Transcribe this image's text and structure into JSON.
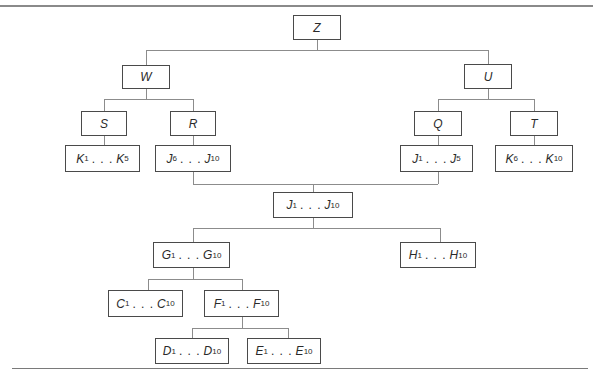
{
  "figure": {
    "caption": "Figure 10-20  (caption text cropped at top edge)"
  },
  "tree": {
    "nodes": [
      {
        "id": "Z",
        "label": "Z",
        "start": {
          "letter": "Z"
        },
        "x": 293,
        "y": 15,
        "w": 48,
        "h": 25
      },
      {
        "id": "W",
        "label": "W",
        "x": 122,
        "y": 65,
        "w": 48,
        "h": 24
      },
      {
        "id": "U",
        "label": "U",
        "x": 464,
        "y": 64,
        "w": 48,
        "h": 25
      },
      {
        "id": "S",
        "label": "S",
        "x": 81,
        "y": 111,
        "w": 46,
        "h": 25
      },
      {
        "id": "R",
        "label": "R",
        "x": 170,
        "y": 111,
        "w": 46,
        "h": 25
      },
      {
        "id": "Q",
        "label": "Q",
        "x": 414,
        "y": 111,
        "w": 48,
        "h": 25
      },
      {
        "id": "T",
        "label": "T",
        "x": 510,
        "y": 111,
        "w": 48,
        "h": 25
      },
      {
        "id": "K1K5",
        "from": "K",
        "from_sub": "1",
        "to": "K",
        "to_sub": "5",
        "x": 65,
        "y": 145,
        "w": 75,
        "h": 27
      },
      {
        "id": "J6J10",
        "from": "J",
        "from_sub": "6",
        "to": "J",
        "to_sub": "10",
        "x": 155,
        "y": 145,
        "w": 76,
        "h": 27
      },
      {
        "id": "J1J5",
        "from": "J",
        "from_sub": "1",
        "to": "J",
        "to_sub": "5",
        "x": 400,
        "y": 145,
        "w": 73,
        "h": 27
      },
      {
        "id": "K6K10",
        "from": "K",
        "from_sub": "6",
        "to": "K",
        "to_sub": "10",
        "x": 495,
        "y": 145,
        "w": 78,
        "h": 27
      },
      {
        "id": "J1J10",
        "from": "J",
        "from_sub": "1",
        "to": "J",
        "to_sub": "10",
        "x": 273,
        "y": 192,
        "w": 80,
        "h": 26
      },
      {
        "id": "G1G10",
        "from": "G",
        "from_sub": "1",
        "to": "G",
        "to_sub": "10",
        "x": 153,
        "y": 242,
        "w": 77,
        "h": 26
      },
      {
        "id": "H1H10",
        "from": "H",
        "from_sub": "1",
        "to": "H",
        "to_sub": "10",
        "x": 400,
        "y": 242,
        "w": 76,
        "h": 26
      },
      {
        "id": "C1C10",
        "from": "C",
        "from_sub": "1",
        "to": "C",
        "to_sub": "10",
        "x": 108,
        "y": 290,
        "w": 75,
        "h": 27
      },
      {
        "id": "F1F10",
        "from": "F",
        "from_sub": "1",
        "to": "F",
        "to_sub": "10",
        "x": 204,
        "y": 290,
        "w": 75,
        "h": 27
      },
      {
        "id": "D1D10",
        "from": "D",
        "from_sub": "1",
        "to": "D",
        "to_sub": "10",
        "x": 155,
        "y": 338,
        "w": 74,
        "h": 26
      },
      {
        "id": "E1E10",
        "from": "E",
        "from_sub": "1",
        "to": "E",
        "to_sub": "10",
        "x": 247,
        "y": 338,
        "w": 74,
        "h": 26
      }
    ],
    "edges": [
      {
        "parent": "Z",
        "children": [
          "W",
          "U"
        ]
      },
      {
        "parent": "W",
        "children": [
          "S",
          "R"
        ]
      },
      {
        "parent": "U",
        "children": [
          "Q",
          "T"
        ]
      },
      {
        "parent": "S",
        "children": [
          "K1K5"
        ]
      },
      {
        "parent": "R",
        "children": [
          "J6J10"
        ]
      },
      {
        "parent": "Q",
        "children": [
          "J1J5"
        ]
      },
      {
        "parent": "T",
        "children": [
          "K6K10"
        ]
      },
      {
        "parent": "J1J10",
        "children_above": [
          "J6J10",
          "J1J5"
        ]
      },
      {
        "parent": "J1J10",
        "children": [
          "G1G10",
          "H1H10"
        ]
      },
      {
        "parent": "G1G10",
        "children": [
          "C1C10",
          "F1F10"
        ]
      },
      {
        "parent": "F1F10",
        "children": [
          "D1D10",
          "E1E10"
        ]
      }
    ],
    "ellipsis": ". . .",
    "colors": {
      "line": "#8c8c8c",
      "border": "#4a4a4a",
      "text": "#2a2a2a",
      "background": "#ffffff"
    }
  },
  "labels": {
    "Z": "Z",
    "W": "W",
    "U": "U",
    "S": "S",
    "R": "R",
    "Q": "Q",
    "T": "T",
    "K1K5": {
      "a": "K",
      "as": "1",
      "b": "K",
      "bs": "5"
    },
    "J6J10": {
      "a": "J",
      "as": "6",
      "b": "J",
      "bs": "10"
    },
    "J1J5": {
      "a": "J",
      "as": "1",
      "b": "J",
      "bs": "5"
    },
    "K6K10": {
      "a": "K",
      "as": "6",
      "b": "K",
      "bs": "10"
    },
    "J1J10": {
      "a": "J",
      "as": "1",
      "b": "J",
      "bs": "10"
    },
    "G1G10": {
      "a": "G",
      "as": "1",
      "b": "G",
      "bs": "10"
    },
    "H1H10": {
      "a": "H",
      "as": "1",
      "b": "H",
      "bs": "10"
    },
    "C1C10": {
      "a": "C",
      "as": "1",
      "b": "C",
      "bs": "10"
    },
    "F1F10": {
      "a": "F",
      "as": "1",
      "b": "F",
      "bs": "10"
    },
    "D1D10": {
      "a": "D",
      "as": "1",
      "b": "D",
      "bs": "10"
    },
    "E1E10": {
      "a": "E",
      "as": "1",
      "b": "E",
      "bs": "10"
    }
  }
}
